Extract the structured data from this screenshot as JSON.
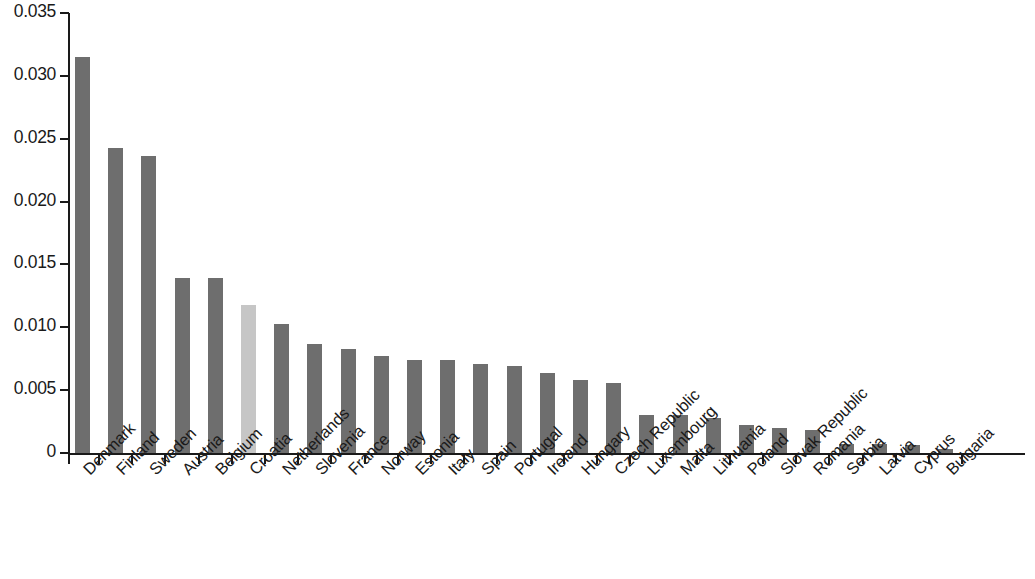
{
  "chart_data": {
    "type": "bar",
    "title": "",
    "subtitle": "",
    "xlabel": "",
    "ylabel": "",
    "ylim": [
      0,
      0.035
    ],
    "grid": false,
    "legend": null,
    "y_ticks": [
      "0",
      "0.005",
      "0.010",
      "0.015",
      "0.020",
      "0.025",
      "0.030",
      "0.035"
    ],
    "y_tick_values": [
      0,
      0.005,
      0.01,
      0.015,
      0.02,
      0.025,
      0.03,
      0.035
    ],
    "categories": [
      "Denmark",
      "Finland",
      "Sweden",
      "Austria",
      "Belgium",
      "Croatia",
      "Netherlands",
      "Slovenia",
      "France",
      "Norway",
      "Estonia",
      "Italy",
      "Spain",
      "Portugal",
      "Ireland",
      "Hungary",
      "Czech Republic",
      "Luxembourg",
      "Malta",
      "Lithuania",
      "Poland",
      "Slovak Republic",
      "Romania",
      "Serbia",
      "Latvia",
      "Cyprus",
      "Bulgaria"
    ],
    "values": [
      0.0315,
      0.0243,
      0.0236,
      0.0139,
      0.0139,
      0.0118,
      0.0103,
      0.0087,
      0.0083,
      0.0077,
      0.0074,
      0.0074,
      0.0071,
      0.0069,
      0.0064,
      0.0058,
      0.0056,
      0.003,
      0.003,
      0.0028,
      0.0022,
      0.002,
      0.0018,
      0.0007,
      0.0007,
      0.0006,
      0.0003
    ],
    "highlight_index": 5,
    "colors": {
      "bar": "#6e6e6e",
      "bar_highlight": "#c6c6c6",
      "axis": "#1a1a1a",
      "background": "#ffffff"
    }
  }
}
